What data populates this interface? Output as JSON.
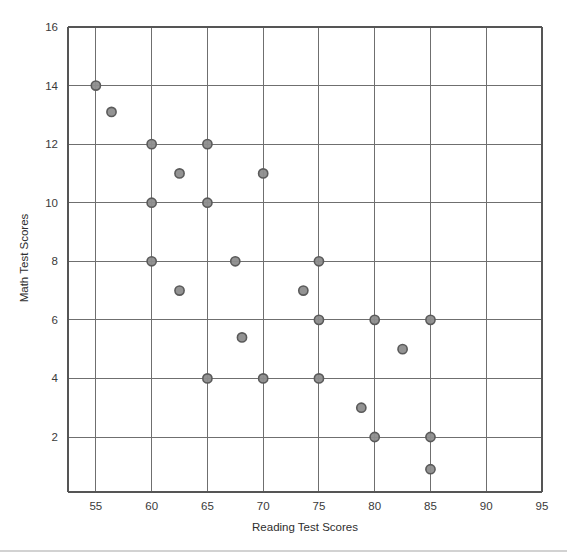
{
  "chart_data": {
    "type": "scatter",
    "title": "",
    "xlabel": "Reading Test Scores",
    "ylabel": "Math Test Scores",
    "xlim": [
      52.5,
      95
    ],
    "ylim": [
      0,
      16
    ],
    "xticks": [
      55,
      60,
      65,
      70,
      75,
      80,
      85,
      90,
      95
    ],
    "xtick_labels": [
      "55",
      "60",
      "65",
      "70",
      "75",
      "80",
      "85",
      "90",
      "95"
    ],
    "yticks": [
      2,
      4,
      6,
      8,
      10,
      12,
      14,
      16
    ],
    "ytick_labels": [
      "2",
      "4",
      "6",
      "8",
      "10",
      "12",
      "14",
      "16"
    ],
    "grid": true,
    "legend": null,
    "marker_color": "#8d8d8d",
    "marker_edge_color": "#5a5a5a",
    "grid_color": "#6f6f6f",
    "points": [
      {
        "x": 55.0,
        "y": 14.0
      },
      {
        "x": 56.4,
        "y": 13.1
      },
      {
        "x": 60.0,
        "y": 12.0
      },
      {
        "x": 65.0,
        "y": 12.0
      },
      {
        "x": 62.5,
        "y": 11.0
      },
      {
        "x": 70.0,
        "y": 11.0
      },
      {
        "x": 60.0,
        "y": 10.0
      },
      {
        "x": 65.0,
        "y": 10.0
      },
      {
        "x": 60.0,
        "y": 8.0
      },
      {
        "x": 67.5,
        "y": 8.0
      },
      {
        "x": 75.0,
        "y": 8.0
      },
      {
        "x": 62.5,
        "y": 7.0
      },
      {
        "x": 73.6,
        "y": 7.0
      },
      {
        "x": 75.0,
        "y": 6.0
      },
      {
        "x": 80.0,
        "y": 6.0
      },
      {
        "x": 85.0,
        "y": 6.0
      },
      {
        "x": 68.1,
        "y": 5.4
      },
      {
        "x": 82.5,
        "y": 5.0
      },
      {
        "x": 65.0,
        "y": 4.0
      },
      {
        "x": 70.0,
        "y": 4.0
      },
      {
        "x": 75.0,
        "y": 4.0
      },
      {
        "x": 78.8,
        "y": 3.0
      },
      {
        "x": 80.0,
        "y": 2.0
      },
      {
        "x": 85.0,
        "y": 2.0
      },
      {
        "x": 85.0,
        "y": 0.9
      }
    ]
  }
}
